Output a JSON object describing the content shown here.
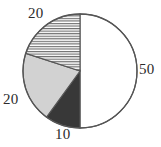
{
  "chart_data": {
    "type": "pie",
    "title": "",
    "subtitle": "",
    "xlabel": "",
    "ylabel": "",
    "legend": "none",
    "grid": false,
    "total": 100,
    "units": "percent",
    "start_angle_deg": 0,
    "direction": "clockwise",
    "categories": [
      "50",
      "10",
      "20",
      "20"
    ],
    "values": [
      50,
      10,
      20,
      20
    ],
    "slices": [
      {
        "label": "50",
        "value": 50,
        "sweep_deg": 180,
        "start_deg": 0,
        "end_deg": 180,
        "fill": "#ffffff",
        "pattern": "solid",
        "label_position": "right"
      },
      {
        "label": "10",
        "value": 10,
        "sweep_deg": 36,
        "start_deg": 180,
        "end_deg": 216,
        "fill": "#383838",
        "pattern": "solid",
        "label_position": "bottom"
      },
      {
        "label": "20",
        "value": 20,
        "sweep_deg": 72,
        "start_deg": 216,
        "end_deg": 288,
        "fill": "#d2d2d2",
        "pattern": "solid",
        "label_position": "left"
      },
      {
        "label": "20",
        "value": 20,
        "sweep_deg": 72,
        "start_deg": 288,
        "end_deg": 360,
        "fill": "#ffffff",
        "pattern": "horizontal-lines",
        "label_position": "top"
      }
    ],
    "labels": {
      "top": "20",
      "right": "50",
      "left": "20",
      "bottom": "10"
    },
    "geometry": {
      "center_x": 80,
      "center_y": 71,
      "radius": 57
    },
    "colors": {
      "outline": "#555555",
      "white_slice": "#ffffff",
      "gray_slice": "#d2d2d2",
      "dark_slice": "#383838",
      "hatch_line": "#6e6e6e",
      "label_text": "#2b2b2b",
      "background": "#ffffff"
    }
  }
}
